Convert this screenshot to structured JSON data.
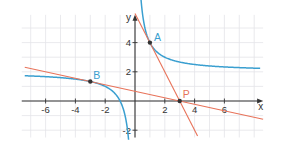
{
  "chart_data": {
    "type": "line",
    "title": "",
    "xlabel": "x",
    "ylabel": "y",
    "xlim": [
      -7.6,
      8.6
    ],
    "ylim": [
      -2.5,
      5.9
    ],
    "grid": true,
    "x_ticks": [
      -6,
      -4,
      -2,
      2,
      4,
      6
    ],
    "y_ticks": [
      -2,
      2,
      4
    ],
    "x_tick_labels": [
      "-6",
      "-4",
      "-2",
      "2",
      "4",
      "6"
    ],
    "y_tick_labels": [
      "-2",
      "2",
      "4"
    ],
    "series": [
      {
        "name": "f(x) = 2 + 2/x",
        "kind": "function",
        "color": "#3a9fd0",
        "branches": [
          {
            "x_range": [
              -7.4,
              -0.43
            ]
          },
          {
            "x_range": [
              0.36,
              8.4
            ]
          }
        ],
        "asymptotes": {
          "horizontal": 2,
          "vertical": 0
        }
      },
      {
        "name": "tangent at A: y = 6 - 2x",
        "kind": "line",
        "color": "#e8735a",
        "slope": -2,
        "intercept": 6,
        "x_range": [
          0.0,
          4.2
        ]
      },
      {
        "name": "tangent at B: y = 2/3 - 2x/9",
        "kind": "line",
        "color": "#e8735a",
        "slope": -0.2222,
        "intercept": 0.6667,
        "x_range": [
          -7.4,
          8.6
        ]
      }
    ],
    "points": [
      {
        "label": "A",
        "x": 1,
        "y": 4,
        "label_color": "#3a9fd0",
        "label_pos": "right"
      },
      {
        "label": "B",
        "x": -3,
        "y": 1.3333,
        "label_color": "#3a9fd0",
        "label_pos": "above-right"
      },
      {
        "label": "P",
        "x": 3,
        "y": 0,
        "label_color": "#e8735a",
        "label_pos": "above-right"
      }
    ],
    "point_color": "#333333"
  }
}
